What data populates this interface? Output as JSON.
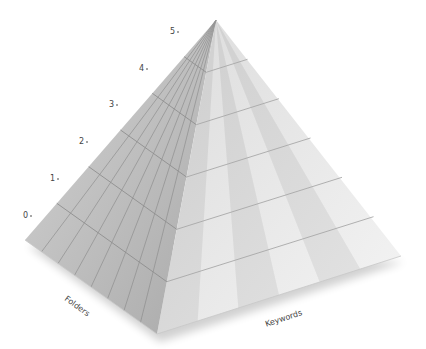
{
  "diagram": {
    "type": "pyramid",
    "levels": [
      "0",
      "1",
      "2",
      "3",
      "4",
      "5"
    ],
    "axes": {
      "left": "Folders",
      "right": "Keywords"
    },
    "colors": {
      "left_face": "#b8b8b8",
      "right_face": "#e6e6e6",
      "grid_line": "#9a9a9a",
      "text": "#444444"
    }
  }
}
